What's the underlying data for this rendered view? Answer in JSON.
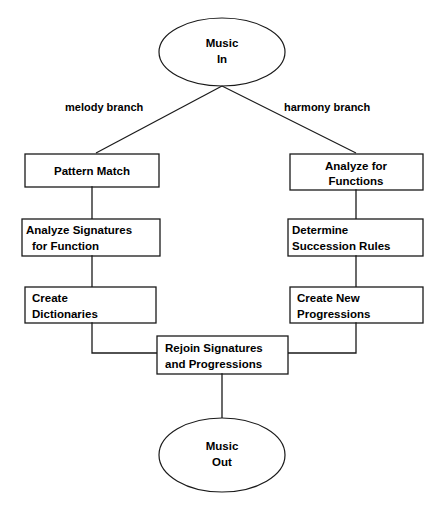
{
  "diagram": {
    "type": "flowchart",
    "stroke_color": "#1a1a1a",
    "fill_color": "#ffffff",
    "text_color": "#000000",
    "terminals": {
      "start": {
        "name": "music-in",
        "line1": "Music",
        "line2": "In"
      },
      "end": {
        "name": "music-out",
        "line1": "Music",
        "line2": "Out"
      }
    },
    "edge_labels": {
      "melody": "melody branch",
      "harmony": "harmony branch"
    },
    "left_branch": [
      {
        "id": "pattern-match",
        "line1": "Pattern Match",
        "line2": "",
        "align": "center"
      },
      {
        "id": "analyze-signatures",
        "line1": "Analyze Signatures",
        "line2": "for Function",
        "align": "left"
      },
      {
        "id": "create-dictionaries",
        "line1": "Create",
        "line2": "Dictionaries",
        "align": "left"
      }
    ],
    "right_branch": [
      {
        "id": "analyze-functions",
        "line1": "Analyze for",
        "line2": "Functions",
        "align": "center"
      },
      {
        "id": "determine-succession",
        "line1": "Determine",
        "line2": "Succession Rules",
        "align": "left"
      },
      {
        "id": "create-progressions",
        "line1": "Create New",
        "line2": "Progressions",
        "align": "left"
      }
    ],
    "merge": {
      "id": "rejoin",
      "line1": "Rejoin Signatures",
      "line2": "and Progressions",
      "align": "left"
    }
  }
}
